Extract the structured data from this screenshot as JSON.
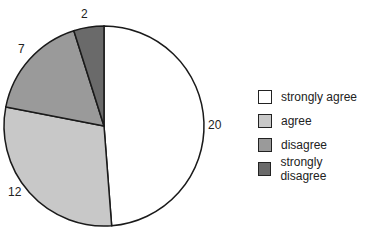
{
  "chart_data": {
    "type": "pie",
    "title": "",
    "categories": [
      "strongly agree",
      "agree",
      "disagree",
      "strongly disagree"
    ],
    "values": [
      20,
      12,
      7,
      2
    ],
    "colors": [
      "#ffffff",
      "#c8c8c8",
      "#9a9a9a",
      "#6a6a6a"
    ],
    "start_angle_deg": 0,
    "direction": "clockwise",
    "legend_position": "right"
  },
  "labels": {
    "strongly_agree": "20",
    "agree": "12",
    "disagree": "7",
    "strongly_disagree": "2"
  },
  "legend": [
    {
      "label": "strongly agree",
      "color": "#ffffff"
    },
    {
      "label": "agree",
      "color": "#c8c8c8"
    },
    {
      "label": "disagree",
      "color": "#9a9a9a"
    },
    {
      "label": "strongly disagree",
      "color": "#6a6a6a"
    }
  ]
}
